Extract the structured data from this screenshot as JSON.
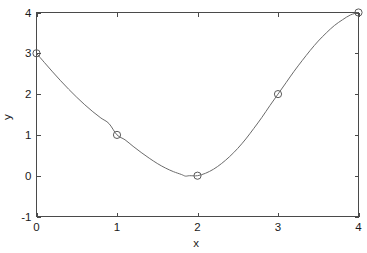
{
  "figure": {
    "background_color": "#ffffff",
    "axes_color": "#4a4a4a",
    "curve_color": "#6b6b6b",
    "marker_color": "#5a5a5a"
  },
  "chart_data": {
    "type": "line",
    "title": "",
    "xlabel": "x",
    "ylabel": "y",
    "xlim": [
      0,
      4
    ],
    "ylim": [
      -1,
      4
    ],
    "xticks": [
      0,
      1,
      2,
      3,
      4
    ],
    "xtick_labels": [
      "0",
      "1",
      "2",
      "3",
      "4"
    ],
    "yticks": [
      -1,
      0,
      1,
      2,
      3,
      4
    ],
    "ytick_labels": [
      "-1",
      "0",
      "1",
      "2",
      "3",
      "4"
    ],
    "grid": false,
    "legend": null,
    "box": true,
    "series": [
      {
        "name": "interpolant",
        "marker": "o",
        "marker_filled": false,
        "line_style": "-",
        "x": [
          0,
          1,
          2,
          3,
          4
        ],
        "y": [
          3,
          1,
          0,
          2,
          4
        ],
        "interpolated_curve": [
          [
            0.0,
            3.0
          ],
          [
            0.1,
            2.77
          ],
          [
            0.2,
            2.545
          ],
          [
            0.3,
            2.327
          ],
          [
            0.4,
            2.119
          ],
          [
            0.5,
            1.922
          ],
          [
            0.6,
            1.738
          ],
          [
            0.7,
            1.568
          ],
          [
            0.8,
            1.414
          ],
          [
            0.9,
            1.279
          ],
          [
            1.0,
            1.0
          ],
          [
            1.1,
            0.88
          ],
          [
            1.2,
            0.72
          ],
          [
            1.3,
            0.57
          ],
          [
            1.4,
            0.43
          ],
          [
            1.5,
            0.3
          ],
          [
            1.6,
            0.19
          ],
          [
            1.7,
            0.1
          ],
          [
            1.8,
            0.03
          ],
          [
            1.85,
            -0.01
          ],
          [
            1.9,
            0.0
          ],
          [
            2.0,
            0.0
          ],
          [
            2.1,
            0.06
          ],
          [
            2.2,
            0.16
          ],
          [
            2.3,
            0.3
          ],
          [
            2.4,
            0.47
          ],
          [
            2.5,
            0.67
          ],
          [
            2.6,
            0.9
          ],
          [
            2.7,
            1.16
          ],
          [
            2.8,
            1.43
          ],
          [
            2.9,
            1.72
          ],
          [
            3.0,
            2.0
          ],
          [
            3.1,
            2.28
          ],
          [
            3.2,
            2.56
          ],
          [
            3.3,
            2.82
          ],
          [
            3.4,
            3.07
          ],
          [
            3.5,
            3.3
          ],
          [
            3.6,
            3.5
          ],
          [
            3.7,
            3.68
          ],
          [
            3.8,
            3.82
          ],
          [
            3.9,
            3.94
          ],
          [
            4.0,
            4.0
          ]
        ]
      }
    ]
  }
}
